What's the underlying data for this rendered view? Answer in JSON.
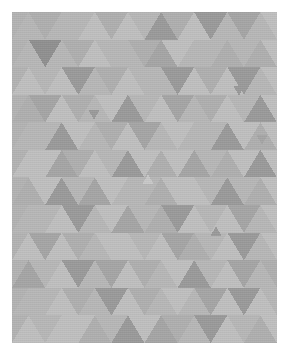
{
  "artwork": {
    "title": "Low-Poly Triangle Mosaic",
    "style": "geometric-abstract",
    "description": "Grayscale low-poly mosaic of alternating upward and downward equilateral triangles arranged on a regular isometric grid, framed by a white border.",
    "canvas": {
      "width": 287,
      "height": 355,
      "background": "#ffffff"
    },
    "frame": {
      "x": 12,
      "y": 12,
      "width": 265,
      "height": 331,
      "base_fill": "#b4b4b4"
    },
    "grid": {
      "columns": 16,
      "rows": 12,
      "cell_width": 33.125,
      "cell_height": 27.583,
      "orientation": "alternating-up-down"
    },
    "palette": {
      "lightest": "#c9c9c9",
      "light": "#c0c0c0",
      "mid_light": "#b8b8b8",
      "mid": "#b0b0b0",
      "mid_dark": "#a6a6a6",
      "dark": "#9b9b9b",
      "darkest": "#919191",
      "white_border": "#ffffff"
    },
    "tones": [
      "#c9c9c9",
      "#c0c0c0",
      "#b8b8b8",
      "#b0b0b0",
      "#a6a6a6",
      "#9b9b9b",
      "#919191"
    ],
    "tone_labels": [
      "lightest",
      "light",
      "mid-light",
      "mid",
      "mid-dark",
      "dark",
      "darkest"
    ],
    "rows_tone_index": [
      [
        2,
        1,
        5,
        3,
        2,
        2,
        1,
        3,
        1,
        2,
        5,
        3,
        1,
        5,
        2,
        4
      ],
      [
        2,
        3,
        1,
        2,
        6,
        2,
        3,
        1,
        2,
        2,
        3,
        4,
        1,
        2,
        2,
        3
      ],
      [
        1,
        5,
        2,
        1,
        3,
        2,
        1,
        5,
        2,
        3,
        1,
        2,
        2,
        5,
        1,
        3
      ],
      [
        3,
        1,
        2,
        5,
        1,
        2,
        4,
        1,
        3,
        2,
        1,
        5,
        2,
        1,
        4,
        2
      ],
      [
        2,
        2,
        5,
        1,
        3,
        1,
        2,
        2,
        5,
        1,
        2,
        3,
        1,
        4,
        2,
        1
      ],
      [
        1,
        4,
        2,
        3,
        1,
        5,
        1,
        2,
        1,
        4,
        3,
        1,
        2,
        5,
        1,
        3
      ],
      [
        3,
        1,
        1,
        2,
        5,
        2,
        3,
        1,
        2,
        1,
        5,
        2,
        4,
        1,
        2,
        2
      ],
      [
        2,
        3,
        5,
        1,
        2,
        1,
        4,
        2,
        1,
        3,
        2,
        1,
        5,
        2,
        1,
        4
      ],
      [
        1,
        2,
        1,
        4,
        3,
        2,
        1,
        5,
        2,
        1,
        2,
        4,
        1,
        3,
        2,
        1
      ],
      [
        4,
        1,
        3,
        2,
        1,
        5,
        2,
        1,
        4,
        2,
        3,
        1,
        2,
        1,
        5,
        2
      ],
      [
        2,
        5,
        1,
        3,
        2,
        1,
        2,
        4,
        1,
        5,
        1,
        2,
        3,
        2,
        1,
        3
      ],
      [
        1,
        3,
        2,
        5,
        1,
        4,
        3,
        2,
        5,
        1,
        2,
        3,
        1,
        4,
        2,
        1
      ]
    ],
    "accents": [
      {
        "name": "small-nested-triangle-upper",
        "cx": 82,
        "cy": 103,
        "size": 11,
        "direction": "down",
        "tone_index": 5
      },
      {
        "name": "small-nested-triangle-right",
        "cx": 227,
        "cy": 79,
        "size": 11,
        "direction": "down",
        "tone_index": 5
      },
      {
        "name": "small-nested-triangle-center",
        "cx": 136,
        "cy": 167,
        "size": 11,
        "direction": "up",
        "tone_index": 0
      },
      {
        "name": "small-nested-triangle-lower",
        "cx": 204,
        "cy": 219,
        "size": 11,
        "direction": "up",
        "tone_index": 5
      },
      {
        "name": "small-nested-triangle-mid",
        "cx": 250,
        "cy": 128,
        "size": 11,
        "direction": "down",
        "tone_index": 4
      }
    ],
    "texture": {
      "type": "fine-paper-grain",
      "opacity": 0.055
    }
  }
}
